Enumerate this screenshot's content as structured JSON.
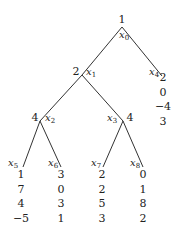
{
  "diagram": {
    "type": "game-tree",
    "nodes": {
      "x0": {
        "label": "x",
        "sub": "0",
        "value": "1"
      },
      "x1": {
        "label": "x",
        "sub": "1",
        "value": "2"
      },
      "x2": {
        "label": "x",
        "sub": "2",
        "value": "4"
      },
      "x3": {
        "label": "x",
        "sub": "3",
        "value": "4"
      },
      "x4": {
        "label": "x",
        "sub": "4"
      },
      "x5": {
        "label": "x",
        "sub": "5"
      },
      "x6": {
        "label": "x",
        "sub": "6"
      },
      "x7": {
        "label": "x",
        "sub": "7"
      },
      "x8": {
        "label": "x",
        "sub": "8"
      }
    },
    "edges": [
      [
        "x0",
        "x1"
      ],
      [
        "x0",
        "x4"
      ],
      [
        "x1",
        "x2"
      ],
      [
        "x1",
        "x3"
      ],
      [
        "x2",
        "x5"
      ],
      [
        "x2",
        "x6"
      ],
      [
        "x3",
        "x7"
      ],
      [
        "x3",
        "x8"
      ]
    ],
    "payoffs": {
      "x4": [
        "2",
        "0",
        "−4",
        "3"
      ],
      "x5": [
        "1",
        "7",
        "4",
        "−5"
      ],
      "x6": [
        "3",
        "0",
        "3",
        "1"
      ],
      "x7": [
        "2",
        "2",
        "5",
        "3"
      ],
      "x8": [
        "0",
        "1",
        "8",
        "2"
      ]
    }
  }
}
